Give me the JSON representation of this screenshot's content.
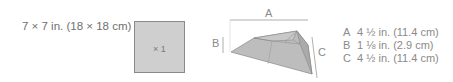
{
  "piece": {
    "size_label": "7 × 7 in. (18 × 18 cm)",
    "count_label": "× 1",
    "fill_color": "#cfcfcf"
  },
  "diagram": {
    "labels": {
      "a": "A",
      "b": "B",
      "c": "C"
    }
  },
  "dimensions": [
    {
      "key": "A",
      "value": "4 ½ in. (11.4 cm)"
    },
    {
      "key": "B",
      "value": "1 ⅛ in. (2.9 cm)"
    },
    {
      "key": "C",
      "value": "4 ½ in. (11.4 cm)"
    }
  ]
}
